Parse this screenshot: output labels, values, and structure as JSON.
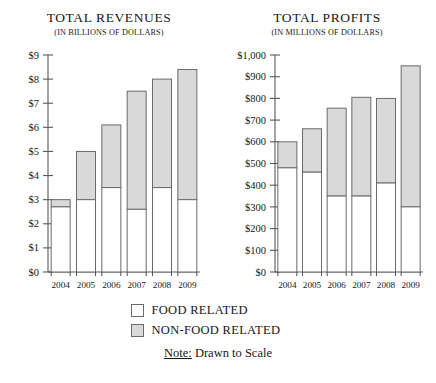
{
  "charts": [
    {
      "id": "total-revenues",
      "title": "TOTAL REVENUES",
      "subtitle": "(IN BILLIONS OF DOLLARS)"
    },
    {
      "id": "total-profits",
      "title": "TOTAL PROFITS",
      "subtitle": "(IN MILLIONS OF DOLLARS)"
    }
  ],
  "legend": {
    "food_label": "FOOD RELATED",
    "nonfood_label": "NON-FOOD RELATED",
    "note_label": "Note:",
    "note_text": " Drawn to Scale"
  },
  "colors": {
    "food": "#ffffff",
    "nonfood": "#d9d9d9",
    "stroke": "#6b6b6b",
    "axis": "#5a5a5a",
    "text": "#171717"
  },
  "chart_data": [
    {
      "type": "bar",
      "stacked": true,
      "title": "TOTAL REVENUES",
      "subtitle": "(IN BILLIONS OF DOLLARS)",
      "xlabel": "",
      "ylabel": "",
      "ylim": [
        0,
        9
      ],
      "ytick_step": 1,
      "ytick_labels": [
        "$0",
        "$1",
        "$2",
        "$3",
        "$4",
        "$5",
        "$6",
        "$7",
        "$8",
        "$9"
      ],
      "ytick_values": [
        0,
        1,
        2,
        3,
        4,
        5,
        6,
        7,
        8,
        9
      ],
      "grid": false,
      "legend_position": "below",
      "categories": [
        "2004",
        "2005",
        "2006",
        "2007",
        "2008",
        "2009"
      ],
      "series": [
        {
          "name": "FOOD RELATED",
          "values": [
            2.7,
            3.0,
            3.5,
            2.6,
            3.5,
            3.0
          ]
        },
        {
          "name": "NON-FOOD RELATED",
          "values": [
            0.3,
            2.0,
            2.6,
            4.9,
            4.5,
            5.4
          ]
        }
      ],
      "totals": [
        3.0,
        5.0,
        6.1,
        7.5,
        8.0,
        8.4
      ]
    },
    {
      "type": "bar",
      "stacked": true,
      "title": "TOTAL PROFITS",
      "subtitle": "(IN MILLIONS OF DOLLARS)",
      "xlabel": "",
      "ylabel": "",
      "ylim": [
        0,
        1000
      ],
      "ytick_step": 100,
      "ytick_labels": [
        "$0",
        "$100",
        "$200",
        "$300",
        "$400",
        "$500",
        "$600",
        "$700",
        "$800",
        "$900",
        "$1,000"
      ],
      "ytick_values": [
        0,
        100,
        200,
        300,
        400,
        500,
        600,
        700,
        800,
        900,
        1000
      ],
      "grid": false,
      "legend_position": "below",
      "categories": [
        "2004",
        "2005",
        "2006",
        "2007",
        "2008",
        "2009"
      ],
      "series": [
        {
          "name": "FOOD RELATED",
          "values": [
            480,
            460,
            350,
            350,
            410,
            300
          ]
        },
        {
          "name": "NON-FOOD RELATED",
          "values": [
            120,
            200,
            405,
            455,
            390,
            650
          ]
        }
      ],
      "totals": [
        600,
        660,
        755,
        805,
        800,
        950
      ]
    }
  ]
}
